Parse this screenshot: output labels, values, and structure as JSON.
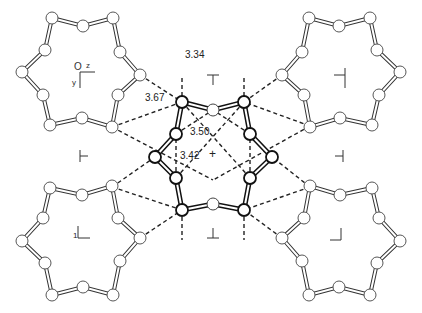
{
  "figure": {
    "type": "crystal packing diagram"
  },
  "axes": {
    "origin": "O",
    "z": "z",
    "y": "y"
  },
  "distances": [
    {
      "id": "d1",
      "value": "3.34"
    },
    {
      "id": "d2",
      "value": "3.67"
    },
    {
      "id": "d3",
      "value": "3.50"
    },
    {
      "id": "d4",
      "value": "3.42"
    }
  ],
  "symmetry_symbols": {
    "center": "+",
    "top": "⊤",
    "bottom": "⊥",
    "left": "⊢",
    "right": "⊣",
    "bottom_left_num": "1"
  },
  "colors": {
    "line": "#222222",
    "background": "#ffffff"
  }
}
